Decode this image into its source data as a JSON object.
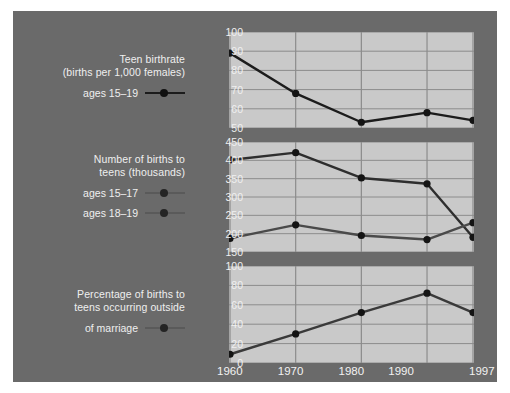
{
  "figure": {
    "background_color": "#6a6a6a",
    "panel_color": "#c9c9c9",
    "grid_color": "#8c8c8c",
    "text_color": "#f0f0f0"
  },
  "legend": {
    "groups": [
      {
        "id": "birthrate",
        "title_line1": "Teen birthrate",
        "title_line2": "(births per 1,000 females)",
        "entries": [
          {
            "label": "ages 15–19",
            "color": "#1c1c1c",
            "marker": "circle"
          }
        ]
      },
      {
        "id": "number",
        "title_line1": "Number of births to",
        "title_line2": "teens (thousands)",
        "entries": [
          {
            "label": "ages 15–17",
            "color": "#4a4a4a",
            "marker": "circle"
          },
          {
            "label": "ages 18–19",
            "color": "#2e2e2e",
            "marker": "circle"
          }
        ]
      },
      {
        "id": "pct",
        "title_line1": "Percentage of births to",
        "title_line2": "teens occurring outside",
        "title_line3": "of marriage",
        "entries": [
          {
            "label": "",
            "color": "#3a3a3a",
            "marker": "circle"
          }
        ]
      }
    ]
  },
  "axis": {
    "x_ticks": [
      "1960",
      "1970",
      "1980",
      "1990",
      "1997"
    ]
  },
  "chart_data": [
    {
      "id": "panel-birthrate",
      "type": "line",
      "title": "Teen birthrate (births per 1,000 females)",
      "xlabel": "",
      "ylabel": "births per 1,000 females",
      "x": [
        1960,
        1970,
        1980,
        1990,
        1997
      ],
      "xlim": [
        1960,
        1997
      ],
      "ylim": [
        50,
        100
      ],
      "yticks": [
        50,
        60,
        70,
        80,
        90,
        100
      ],
      "grid": true,
      "legend_position": "left-outside",
      "series": [
        {
          "name": "ages 15–19",
          "color": "#1c1c1c",
          "values": [
            89,
            68,
            53,
            58,
            54
          ]
        }
      ]
    },
    {
      "id": "panel-number",
      "type": "line",
      "title": "Number of births to teens (thousands)",
      "xlabel": "",
      "ylabel": "thousands of births",
      "x": [
        1960,
        1970,
        1980,
        1990,
        1997
      ],
      "xlim": [
        1960,
        1997
      ],
      "ylim": [
        150,
        450
      ],
      "yticks": [
        150,
        200,
        250,
        300,
        350,
        400,
        450
      ],
      "grid": true,
      "legend_position": "left-outside",
      "series": [
        {
          "name": "ages 18–19",
          "color": "#2e2e2e",
          "values": [
            401,
            421,
            352,
            336,
            190
          ]
        },
        {
          "name": "ages 15–17",
          "color": "#4a4a4a",
          "values": [
            187,
            224,
            195,
            184,
            230
          ]
        }
      ]
    },
    {
      "id": "panel-pct",
      "type": "line",
      "title": "Percentage of births to teens occurring outside of marriage",
      "xlabel": "",
      "ylabel": "percent",
      "x": [
        1960,
        1970,
        1980,
        1990,
        1997
      ],
      "xlim": [
        1960,
        1997
      ],
      "ylim": [
        0,
        100
      ],
      "yticks": [
        0,
        20,
        40,
        60,
        80,
        100
      ],
      "grid": true,
      "legend_position": "left-outside",
      "series": [
        {
          "name": "percentage outside of marriage",
          "color": "#3a3a3a",
          "values": [
            9,
            30,
            52,
            72,
            52
          ]
        }
      ]
    }
  ]
}
